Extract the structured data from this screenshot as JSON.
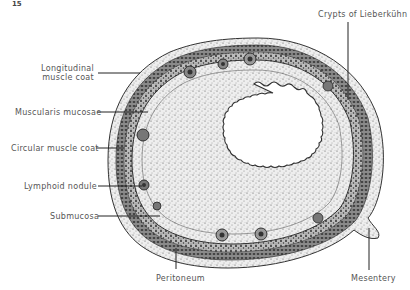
{
  "figure": {
    "number": "15",
    "colors": {
      "background": "#ffffff",
      "ink": "#2a2a2a",
      "tissue_light": "#d9d9d9",
      "tissue_dark": "#3a3a3a",
      "label_text": "#555555"
    }
  },
  "labels": {
    "crypts": "Crypts of Lieberkühn",
    "longitudinal_line1": "Longitudinal",
    "longitudinal_line2": "muscle coat",
    "muscularis": "Muscularis mucosae",
    "circular": "Circular muscle coat",
    "lymphoid": "Lymphoid nodule",
    "submucosa": "Submucosa",
    "peritoneum": "Peritoneum",
    "mesentery": "Mesentery"
  }
}
